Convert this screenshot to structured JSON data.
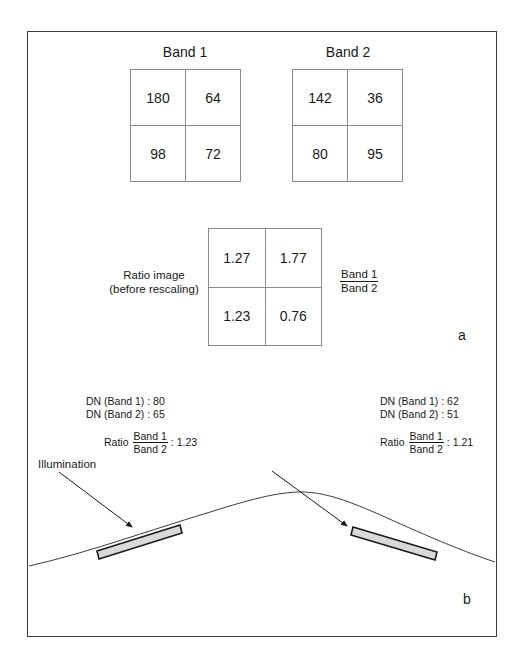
{
  "running_header": "ENHANCING THE IMAGERY",
  "panel_a": {
    "band1": {
      "title": "Band 1",
      "cells": [
        "180",
        "64",
        "98",
        "72"
      ]
    },
    "band2": {
      "title": "Band 2",
      "cells": [
        "142",
        "36",
        "80",
        "95"
      ]
    },
    "ratio": {
      "label_line1": "Ratio image",
      "label_line2": "(before rescaling)",
      "cells": [
        "1.27",
        "1.77",
        "1.23",
        "0.76"
      ],
      "fraction_numerator": "Band 1",
      "fraction_denominator": "Band 2"
    },
    "letter": "a"
  },
  "panel_b": {
    "left_facet": {
      "dn_band1": "DN (Band 1) : 80",
      "dn_band2": "DN (Band 2) : 65",
      "ratio_word": "Ratio",
      "fraction_numerator": "Band 1",
      "fraction_denominator": "Band 2",
      "ratio_value": ": 1.23"
    },
    "right_facet": {
      "dn_band1": "DN (Band 1) : 62",
      "dn_band2": "DN (Band 2) : 51",
      "ratio_word": "Ratio",
      "fraction_numerator": "Band 1",
      "fraction_denominator": "Band 2",
      "ratio_value": ": 1.21"
    },
    "illumination_label": "Illumination",
    "letter": "b"
  },
  "colors": {
    "frame_border": "#3c3c3c",
    "grid_line": "#8c8c8c",
    "facet_fill": "#d9d9d9",
    "facet_stroke": "#1a1a1a",
    "terrain_stroke": "#3c3c3c",
    "text": "#1a1a1a"
  }
}
